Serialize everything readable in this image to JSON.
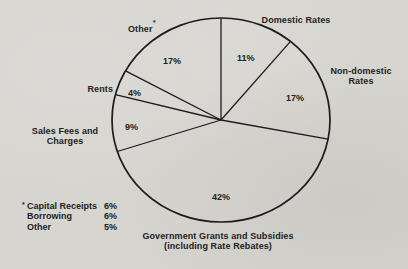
{
  "chart_data": {
    "type": "pie",
    "title": "",
    "direction": "clockwise",
    "start_angle_deg": 0,
    "legend_position": "none",
    "slices": [
      {
        "name": "Domestic Rates",
        "value": 11,
        "pct": "11%"
      },
      {
        "name": "Non-domestic Rates",
        "value": 17,
        "pct": "17%"
      },
      {
        "name": "Government Grants and Subsidies",
        "sub": "(including Rate Rebates)",
        "value": 42,
        "pct": "42%"
      },
      {
        "name": "Sales Fees and Charges",
        "value": 9,
        "pct": "9%"
      },
      {
        "name": "Rents",
        "value": 4,
        "pct": "4%"
      },
      {
        "name": "Other",
        "marker": "*",
        "value": 17,
        "pct": "17%"
      }
    ],
    "footnote": {
      "marker": "*",
      "rows": [
        {
          "label": "Capital Receipts",
          "value": "6%"
        },
        {
          "label": "Borrowing",
          "value": "6%"
        },
        {
          "label": "Other",
          "value": "5%"
        }
      ]
    },
    "colors": {
      "line": "#1c1c1c",
      "text": "#222220",
      "background": "#d7d5d0"
    }
  }
}
